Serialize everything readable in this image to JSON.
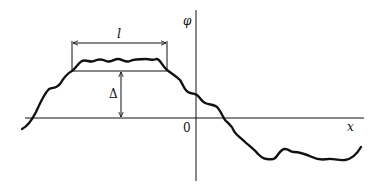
{
  "diagram": {
    "labels": {
      "length": "l",
      "y_axis": "φ",
      "x_axis": "x",
      "origin": "0",
      "height": "Δ"
    },
    "colors": {
      "stroke": "#111111",
      "background": "#ffffff"
    }
  }
}
